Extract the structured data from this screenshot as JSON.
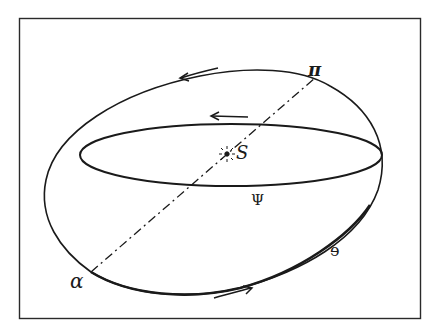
{
  "figure": {
    "labels": {
      "perihelion": "π",
      "aphelion": "α",
      "sun": "S",
      "inner_orbit": "Ψ",
      "outer_orbit": "e"
    },
    "elements": {
      "frame": "rectangular border",
      "outer_orbit": "tilted ellipse",
      "inner_orbit": "flat ellipse",
      "apse_line": "dash-dot line from α to π through S",
      "sun_symbol": "radiating star at S",
      "arrows": [
        "outer orbit top arrow pointing left",
        "inner orbit top arrow pointing left",
        "outer orbit bottom arrow pointing right"
      ]
    },
    "colors": {
      "ink": "#1a1a1a",
      "background": "#ffffff"
    }
  }
}
